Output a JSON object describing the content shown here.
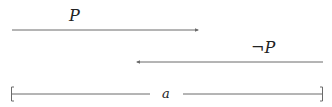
{
  "diagram": {
    "top_arrow": {
      "label": "P",
      "direction": "right",
      "x1": 12,
      "x2": 199,
      "y": 30
    },
    "middle_arrow": {
      "label": "¬P",
      "direction": "left",
      "x1": 136,
      "x2": 323,
      "y": 62
    },
    "interval": {
      "label": "a",
      "x1": 11,
      "x2": 323,
      "y": 94
    }
  },
  "colors": {
    "line": "#6a6a6a",
    "text": "#222222"
  }
}
